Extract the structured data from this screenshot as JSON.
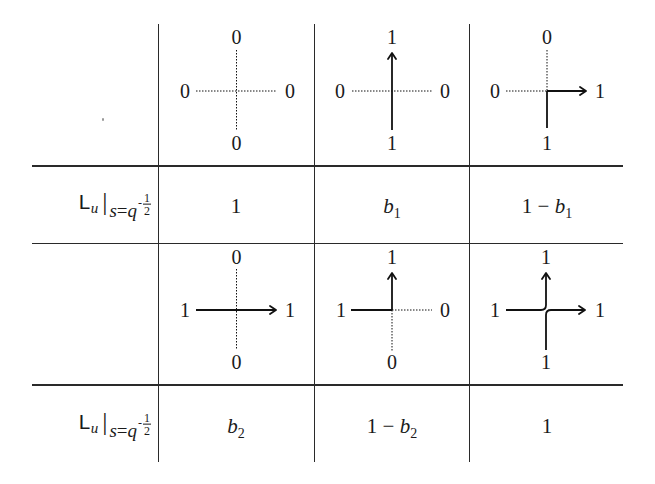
{
  "table": {
    "row_label": {
      "operator": "L",
      "operator_subscript": "u",
      "evaluation_bar": "|",
      "condition_var": "s",
      "condition_eq": "=",
      "condition_base": "q",
      "exponent_sign": "-",
      "exponent_num": "1",
      "exponent_den": "2"
    },
    "blocks": [
      {
        "vertices": [
          {
            "name": "empty-vertex",
            "labels": {
              "top": "0",
              "left": "0",
              "right": "0",
              "bottom": "0"
            },
            "edges": {
              "left": "dotted",
              "right": "dotted",
              "top": "dotted",
              "bottom": "dotted"
            },
            "weight": {
              "main": "1",
              "var": "",
              "var_sub": ""
            }
          },
          {
            "name": "vertical-path-vertex",
            "labels": {
              "top": "1",
              "left": "0",
              "right": "0",
              "bottom": "1"
            },
            "edges": {
              "left": "dotted",
              "right": "dotted",
              "top": "arrow",
              "bottom": "solid"
            },
            "weight": {
              "main": "",
              "var": "b",
              "var_sub": "1"
            }
          },
          {
            "name": "bottom-to-right-turn-vertex",
            "labels": {
              "top": "0",
              "left": "0",
              "right": "1",
              "bottom": "1"
            },
            "edges": {
              "left": "dotted",
              "right": "arrow",
              "top": "dotted",
              "bottom": "solid"
            },
            "weight": {
              "main": "1 − ",
              "var": "b",
              "var_sub": "1"
            }
          }
        ]
      },
      {
        "vertices": [
          {
            "name": "horizontal-path-vertex",
            "labels": {
              "top": "0",
              "left": "1",
              "right": "1",
              "bottom": "0"
            },
            "edges": {
              "left": "solid",
              "right": "arrow",
              "top": "dotted",
              "bottom": "dotted"
            },
            "weight": {
              "main": "",
              "var": "b",
              "var_sub": "2"
            }
          },
          {
            "name": "left-to-top-turn-vertex",
            "labels": {
              "top": "1",
              "left": "1",
              "right": "0",
              "bottom": "0"
            },
            "edges": {
              "left": "solid",
              "right": "dotted",
              "top": "arrow",
              "bottom": "dotted"
            },
            "weight": {
              "main": "1 − ",
              "var": "b",
              "var_sub": "2"
            }
          },
          {
            "name": "full-crossing-vertex",
            "labels": {
              "top": "1",
              "left": "1",
              "right": "1",
              "bottom": "1"
            },
            "edges": {
              "left": "solid",
              "right": "arrow",
              "top": "arrow",
              "bottom": "solid"
            },
            "weight": {
              "main": "1",
              "var": "",
              "var_sub": ""
            }
          }
        ]
      }
    ]
  }
}
